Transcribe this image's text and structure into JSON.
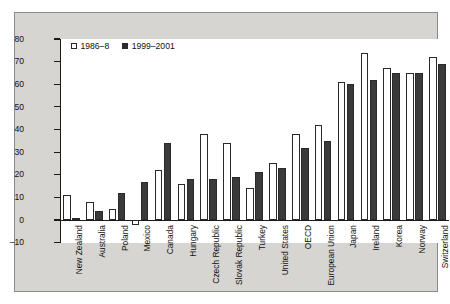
{
  "chart_data": {
    "type": "bar",
    "title": "",
    "subtitle": "",
    "xlabel": "",
    "ylabel": "",
    "ylim": [
      -10,
      80
    ],
    "yticks": [
      -10,
      0,
      10,
      20,
      30,
      40,
      50,
      60,
      70,
      80
    ],
    "grid": false,
    "legend_position": "top-left",
    "categories": [
      "New Zealand",
      "Australia",
      "Poland",
      "Mexico",
      "Canada",
      "Hungary",
      "Czech Republic",
      "Slovak Republic",
      "Turkey",
      "United States",
      "OECD",
      "European Union",
      "Japan",
      "Ireland",
      "Korea",
      "Norway",
      "Switzerland"
    ],
    "series": [
      {
        "name": "1986–8",
        "style": "white",
        "values": [
          11,
          8,
          5,
          -2,
          22,
          16,
          38,
          34,
          14,
          25,
          38,
          42,
          61,
          74,
          67,
          65,
          72
        ]
      },
      {
        "name": "1999–2001",
        "style": "black",
        "values": [
          1,
          4,
          12,
          17,
          34,
          18,
          18,
          19,
          21,
          23,
          32,
          35,
          60,
          62,
          65,
          65,
          69
        ]
      }
    ]
  },
  "legend": {
    "entries": [
      {
        "label": "1986–8",
        "swatch": "white"
      },
      {
        "label": "1999–2001",
        "swatch": "black"
      }
    ]
  },
  "colors": {
    "plate_background": "#d6d5d2",
    "panel_background": "#ffffff",
    "axis": "#1a1a1a",
    "series_white": "#ffffff",
    "series_black": "#3a3a3a"
  }
}
